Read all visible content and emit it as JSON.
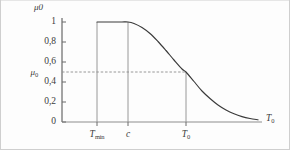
{
  "figure": {
    "background_color": "#fdfdfd",
    "line_color": "#3a3a3a",
    "guide_color": "#8d8d8d"
  },
  "axes": {
    "y_axis_title": "μ",
    "y_axis_title_sub": "0",
    "x_axis_title": "T",
    "x_axis_title_sub": "0",
    "y_ticks": [
      "1",
      "0,8",
      "0,6",
      "0,4",
      "0,2",
      "0"
    ],
    "y_tick_values": [
      1,
      0.8,
      0.6,
      0.4,
      0.2,
      0
    ],
    "x_ticks": [
      {
        "label": "T",
        "sub": "min"
      },
      {
        "label": "c",
        "sub": ""
      },
      {
        "label": "T",
        "sub": "0"
      }
    ]
  },
  "annotations": {
    "mu_level_label": "μ",
    "mu_level_sub": "0",
    "mu_level_value": 0.5
  },
  "chart_data": {
    "type": "line",
    "title": "",
    "subtitle": "",
    "xlabel": "T0",
    "ylabel": "μ0",
    "xlim": [
      0,
      1
    ],
    "ylim": [
      0,
      1.05
    ],
    "grid": false,
    "legend": null,
    "x_markers": {
      "Tmin": 0.175,
      "c": 0.33,
      "T0": 0.62
    },
    "series": [
      {
        "name": "membership",
        "x": [
          0.175,
          0.22,
          0.26,
          0.3,
          0.33,
          0.36,
          0.4,
          0.44,
          0.48,
          0.52,
          0.56,
          0.6,
          0.62,
          0.66,
          0.7,
          0.74,
          0.78,
          0.82,
          0.86,
          0.9,
          0.94,
          0.98
        ],
        "y": [
          1.0,
          1.0,
          1.0,
          1.0,
          1.0,
          0.985,
          0.945,
          0.885,
          0.805,
          0.715,
          0.62,
          0.53,
          0.5,
          0.405,
          0.31,
          0.235,
          0.17,
          0.12,
          0.082,
          0.054,
          0.035,
          0.022
        ]
      }
    ],
    "guides": [
      {
        "type": "vline",
        "at": "Tmin",
        "from_y": 0,
        "to_y": 1.0
      },
      {
        "type": "vline",
        "at": "c",
        "from_y": 0,
        "to_y": 1.0
      },
      {
        "type": "vline",
        "at": "T0",
        "from_y": 0,
        "to_y": 0.5
      },
      {
        "type": "hline",
        "at_y": 0.5,
        "from_x": 0,
        "to_x": "T0",
        "style": "dashed"
      }
    ]
  }
}
